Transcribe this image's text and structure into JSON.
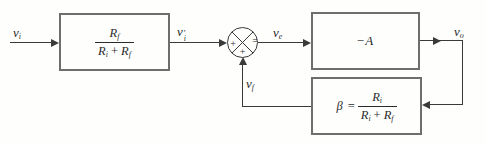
{
  "colors": {
    "background": "#fefefd",
    "wire": "#3a3a3a",
    "box_border": "#6e6e6e",
    "text": "#2b2b2b"
  },
  "signals": {
    "input": {
      "base": "v",
      "sub": "i"
    },
    "divided_input": {
      "base": "v",
      "prime": "′",
      "sub": "i"
    },
    "error": {
      "base": "v",
      "sub": "e"
    },
    "output": {
      "base": "v",
      "sub": "o"
    },
    "feedback": {
      "base": "v",
      "sub": "f"
    }
  },
  "blocks": {
    "input_divider": {
      "numerator": {
        "base": "R",
        "sub": "f"
      },
      "denominator": {
        "term1": {
          "base": "R",
          "sub": "i"
        },
        "operator": "+",
        "term2": {
          "base": "R",
          "sub": "f"
        }
      }
    },
    "amplifier": {
      "minus": "−",
      "letter": "A"
    },
    "feedback_network": {
      "symbol": "β",
      "equals": "=",
      "numerator": {
        "base": "R",
        "sub": "i"
      },
      "denominator": {
        "term1": {
          "base": "R",
          "sub": "i"
        },
        "operator": "+",
        "term2": {
          "base": "R",
          "sub": "f"
        }
      }
    }
  },
  "summing_junction": {
    "left_sign": "+",
    "bottom_sign": "+",
    "right_sign": "="
  }
}
